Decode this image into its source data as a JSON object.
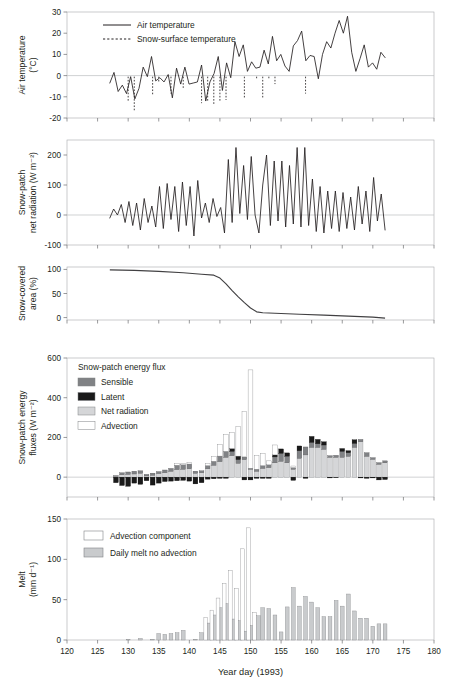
{
  "figure": {
    "x_axis": {
      "label": "Year day (1993)",
      "min": 120,
      "max": 180,
      "ticks": [
        120,
        125,
        130,
        135,
        140,
        145,
        150,
        155,
        160,
        165,
        170,
        175,
        180
      ]
    },
    "panels": [
      {
        "id": "air-temperature",
        "ylabel_lines": [
          "Air temperature",
          "(°C)"
        ],
        "ymin": -20,
        "ymax": 30,
        "yticks": [
          -20,
          -10,
          0,
          10,
          20,
          30
        ],
        "legend": [
          {
            "label": "Air temperature",
            "style": "solid-line"
          },
          {
            "label": "Snow-surface temperature",
            "style": "dashed-line"
          }
        ]
      },
      {
        "id": "net-radiation",
        "ylabel_lines": [
          "Snow-patch",
          "net radiation (W m⁻²)"
        ],
        "ymin": -100,
        "ymax": 250,
        "yticks": [
          -100,
          0,
          100,
          200
        ]
      },
      {
        "id": "snow-covered-area",
        "ylabel_lines": [
          "Snow-covered",
          "area (%)"
        ],
        "ymin": -5,
        "ymax": 105,
        "yticks": [
          0,
          50,
          100
        ]
      },
      {
        "id": "energy-fluxes",
        "ylabel_lines": [
          "Snow-patch energy",
          "fluxes (W m⁻²)"
        ],
        "ymin": -100,
        "ymax": 600,
        "yticks": [
          0,
          200,
          400,
          600
        ],
        "legend_title": "Snow-patch energy flux",
        "legend": [
          {
            "label": "Sensible",
            "color": "#808285"
          },
          {
            "label": "Latent",
            "color": "#1a1a1a"
          },
          {
            "label": "Net radiation",
            "color": "#d5d6d8"
          },
          {
            "label": "Advection",
            "color": "#ffffff"
          }
        ]
      },
      {
        "id": "melt",
        "ylabel_lines": [
          "Melt",
          "(mm d⁻¹)"
        ],
        "ymin": 0,
        "ymax": 150,
        "yticks": [
          0,
          50,
          100,
          150
        ],
        "legend": [
          {
            "label": "Advection component",
            "color": "#ffffff"
          },
          {
            "label": "Daily melt no advection",
            "color": "#c9cbcd"
          }
        ]
      }
    ]
  },
  "chart_data": [
    {
      "type": "line",
      "title": "Air temperature",
      "xlabel": "Year day (1993)",
      "ylabel": "Air temperature (°C)",
      "xlim": [
        120,
        180
      ],
      "ylim": [
        -20,
        30
      ],
      "grid": false,
      "legend_position": "top-left",
      "x": [
        127,
        128,
        129,
        130,
        131,
        132,
        133,
        134,
        135,
        136,
        137,
        138,
        139,
        140,
        141,
        142,
        143,
        144,
        145,
        146,
        147,
        148,
        149,
        150,
        151,
        152,
        153,
        154,
        155,
        156,
        157,
        158,
        159,
        160,
        161,
        162,
        163,
        164,
        165,
        166,
        167,
        168,
        169,
        170,
        171,
        172
      ],
      "series": [
        {
          "name": "Air temperature",
          "values": [
            -3.5,
            1.5,
            -7.5,
            -4.5,
            -8.5,
            -0.5,
            -11,
            -6,
            4,
            -0.5,
            9,
            -2.5,
            -1,
            -3,
            0.5,
            -10.5,
            3.5,
            -4,
            4,
            -4,
            -3.5,
            -3,
            5,
            -12,
            -3,
            1,
            9,
            -7,
            6,
            -1,
            16,
            9,
            14.5,
            2,
            6.5,
            3.5,
            4,
            12,
            5.5,
            18.5,
            7,
            10,
            4.5,
            2,
            14,
            16.5,
            21,
            7,
            9.5,
            9,
            -1.5,
            10,
            16,
            13,
            20,
            26,
            20,
            28,
            11,
            2,
            8,
            14.5,
            4,
            6,
            3,
            11,
            8.5
          ]
        },
        {
          "name": "Snow-surface temperature",
          "values": [
            -12.5,
            -16.5,
            -9.5,
            -3,
            -8.5,
            -6,
            -13,
            -12.5,
            -13.5,
            -12.5,
            -11.5,
            -10.5,
            -2,
            -11,
            -2,
            -4,
            -8.5
          ]
        }
      ],
      "dashed_x": [
        130,
        131,
        134,
        135,
        137,
        139,
        142,
        143,
        144,
        145,
        146,
        149,
        151,
        152,
        153,
        154,
        159
      ]
    },
    {
      "type": "line",
      "title": "Snow-patch net radiation",
      "xlabel": "Year day (1993)",
      "ylabel": "Snow-patch net radiation (W m⁻²)",
      "xlim": [
        120,
        180
      ],
      "ylim": [
        -100,
        250
      ],
      "grid": false,
      "x": [
        127,
        128,
        129,
        130,
        131,
        132,
        133,
        134,
        135,
        136,
        137,
        138,
        139,
        140,
        141,
        142,
        143,
        144,
        145,
        146,
        147,
        148,
        149,
        150,
        151,
        152,
        153,
        154,
        155,
        156,
        157,
        158,
        159,
        160,
        161,
        162,
        163,
        164,
        165,
        166,
        167,
        168,
        169,
        170,
        171,
        172
      ],
      "values": [
        -10,
        20,
        0,
        35,
        -25,
        45,
        -35,
        40,
        -50,
        55,
        -25,
        30,
        -40,
        95,
        -45,
        105,
        -15,
        95,
        -55,
        110,
        -35,
        95,
        -70,
        115,
        -10,
        40,
        -25,
        55,
        -5,
        25,
        -60,
        185,
        -25,
        225,
        5,
        165,
        -15,
        195,
        0,
        -60,
        100,
        200,
        -35,
        180,
        -20,
        180,
        -40,
        165,
        -30,
        225,
        -40,
        225,
        -35,
        120,
        -55,
        95,
        -60,
        80,
        -45,
        80,
        -55,
        75,
        -45,
        60,
        -50,
        95,
        -30,
        80,
        -55,
        125,
        -20,
        70,
        -50
      ]
    },
    {
      "type": "line",
      "title": "Snow-covered area",
      "xlabel": "Year day (1993)",
      "ylabel": "Snow-covered area (%)",
      "xlim": [
        120,
        180
      ],
      "ylim": [
        -5,
        105
      ],
      "grid": false,
      "x": [
        127,
        131,
        135,
        139,
        142,
        144,
        145,
        146,
        147,
        148,
        149,
        150,
        151,
        152,
        154,
        158,
        162,
        166,
        170,
        172
      ],
      "values": [
        99,
        98,
        96,
        93,
        90,
        88,
        82,
        70,
        56,
        43,
        31,
        20,
        12,
        10,
        9,
        7,
        5,
        3,
        1,
        -1
      ]
    },
    {
      "type": "bar",
      "title": "Snow-patch energy flux",
      "subtitle": "stacked components",
      "xlabel": "Year day (1993)",
      "ylabel": "Snow-patch energy fluxes (W m⁻²)",
      "xlim": [
        120,
        180
      ],
      "ylim": [
        -100,
        600
      ],
      "grid": false,
      "legend_position": "top-left",
      "categories": [
        128,
        129,
        130,
        131,
        132,
        133,
        134,
        135,
        136,
        137,
        138,
        139,
        140,
        141,
        142,
        143,
        144,
        145,
        146,
        147,
        148,
        149,
        150,
        151,
        152,
        153,
        154,
        155,
        156,
        157,
        158,
        159,
        160,
        161,
        162,
        163,
        164,
        165,
        166,
        167,
        168,
        169,
        170,
        171,
        172
      ],
      "series": [
        {
          "name": "Net radiation",
          "values": [
            5,
            12,
            14,
            16,
            20,
            6,
            10,
            18,
            22,
            30,
            38,
            40,
            42,
            20,
            22,
            42,
            60,
            78,
            100,
            108,
            70,
            88,
            40,
            30,
            44,
            48,
            72,
            80,
            72,
            40,
            95,
            112,
            150,
            150,
            140,
            100,
            100,
            100,
            105,
            150,
            178,
            105,
            90,
            65,
            72
          ]
        },
        {
          "name": "Sensible",
          "values": [
            3,
            10,
            12,
            14,
            12,
            8,
            10,
            10,
            14,
            14,
            22,
            22,
            24,
            10,
            10,
            16,
            20,
            28,
            30,
            22,
            18,
            14,
            5,
            10,
            14,
            14,
            30,
            40,
            34,
            8,
            38,
            40,
            25,
            18,
            22,
            8,
            10,
            30,
            18,
            20,
            12,
            18,
            8,
            8,
            10
          ]
        },
        {
          "name": "Latent",
          "values": [
            -28,
            -42,
            -46,
            -30,
            -36,
            -18,
            -40,
            -30,
            -22,
            -20,
            -18,
            -16,
            -20,
            -34,
            -28,
            -10,
            -8,
            -6,
            -6,
            14,
            18,
            -14,
            -14,
            -6,
            -6,
            -6,
            10,
            22,
            16,
            -16,
            24,
            -6,
            30,
            22,
            16,
            -4,
            -2,
            14,
            10,
            18,
            -4,
            -6,
            -4,
            -14,
            -12
          ]
        },
        {
          "name": "Advection",
          "values": [
            0,
            0,
            0,
            0,
            0,
            0,
            0,
            0,
            0,
            0,
            8,
            8,
            8,
            0,
            0,
            12,
            25,
            60,
            85,
            80,
            150,
            230,
            495,
            70,
            60,
            20,
            50,
            0,
            0,
            8,
            0,
            0,
            0,
            0,
            0,
            0,
            0,
            0,
            0,
            0,
            0,
            0,
            0,
            0,
            0
          ]
        }
      ]
    },
    {
      "type": "bar",
      "title": "Melt",
      "xlabel": "Year day (1993)",
      "ylabel": "Melt (mm d⁻¹)",
      "xlim": [
        120,
        180
      ],
      "ylim": [
        0,
        150
      ],
      "grid": false,
      "legend_position": "top-left",
      "categories": [
        130,
        132,
        134,
        135,
        136,
        137,
        138,
        139,
        141,
        142,
        143,
        144,
        145,
        146,
        147,
        148,
        149,
        150,
        151,
        152,
        153,
        154,
        155,
        156,
        157,
        158,
        159,
        160,
        161,
        162,
        163,
        164,
        165,
        166,
        167,
        168,
        169,
        170,
        171,
        172
      ],
      "series": [
        {
          "name": "Daily melt no advection",
          "values": [
            1,
            2,
            1,
            8,
            7,
            8,
            9,
            12,
            1,
            9,
            21,
            31,
            40,
            45,
            26,
            24,
            11,
            18,
            30,
            40,
            39,
            31,
            10,
            41,
            65,
            42,
            54,
            47,
            40,
            29,
            29,
            49,
            42,
            57,
            36,
            27,
            27,
            17,
            20,
            20
          ]
        },
        {
          "name": "Advection component",
          "values": [
            0,
            0,
            0,
            0,
            0,
            0,
            0,
            0,
            0,
            0,
            28,
            37,
            52,
            70,
            86,
            64,
            113,
            139,
            34,
            0,
            0,
            0,
            0,
            0,
            0,
            0,
            0,
            0,
            0,
            0,
            0,
            0,
            0,
            0,
            0,
            0,
            0,
            0,
            0,
            0
          ]
        }
      ]
    }
  ]
}
